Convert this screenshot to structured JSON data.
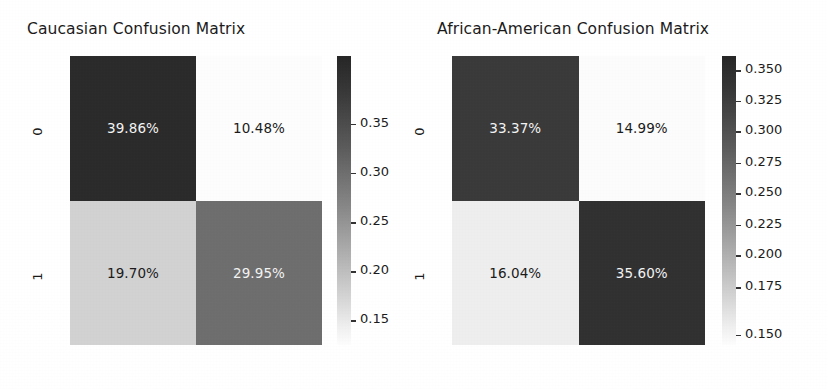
{
  "figure": {
    "background": "#ffffff",
    "colormap": "Greys",
    "panel_count": 2
  },
  "chart_data": [
    {
      "type": "heatmap",
      "title": "Caucasian Confusion Matrix",
      "xlabel": "",
      "ylabel": "",
      "x_ticklabels": [
        "0",
        "1"
      ],
      "y_ticklabels": [
        "0",
        "1"
      ],
      "grid": false,
      "annotation_format": "percent",
      "values": [
        [
          0.3986,
          0.1048
        ],
        [
          0.197,
          0.2995
        ]
      ],
      "annotations": [
        [
          "39.86%",
          "10.48%"
        ],
        [
          "19.70%",
          "29.95%"
        ]
      ],
      "cell_colors": [
        [
          "#2b2b2b",
          "#fdfdfd"
        ],
        [
          "#d2d2d2",
          "#6e6e6e"
        ]
      ],
      "text_colors": [
        [
          "#f2f2f2",
          "#1b1b1b"
        ],
        [
          "#1b1b1b",
          "#f2f2f2"
        ]
      ],
      "colorbar": {
        "position": "right",
        "vmin": 0.1048,
        "vmax": 0.3986,
        "ticks": [
          0.35,
          0.3,
          0.25,
          0.2,
          0.15
        ],
        "ticklabels": [
          "0.35",
          "0.30",
          "0.25",
          "0.20",
          "0.15"
        ],
        "tick_positions_pct": [
          23.5,
          40.5,
          57.5,
          74.5,
          91.5
        ]
      }
    },
    {
      "type": "heatmap",
      "title": "African-American Confusion Matrix",
      "xlabel": "",
      "ylabel": "",
      "x_ticklabels": [
        "0",
        "1"
      ],
      "y_ticklabels": [
        "0",
        "1"
      ],
      "grid": false,
      "annotation_format": "percent",
      "values": [
        [
          0.3337,
          0.1499
        ],
        [
          0.1604,
          0.356
        ]
      ],
      "annotations": [
        [
          "33.37%",
          "14.99%"
        ],
        [
          "16.04%",
          "35.60%"
        ]
      ],
      "cell_colors": [
        [
          "#3a3a3a",
          "#fcfcfc"
        ],
        [
          "#eeeeee",
          "#313131"
        ]
      ],
      "text_colors": [
        [
          "#f2f2f2",
          "#1b1b1b"
        ],
        [
          "#1b1b1b",
          "#f2f2f2"
        ]
      ],
      "colorbar": {
        "position": "right",
        "vmin": 0.1499,
        "vmax": 0.356,
        "ticks": [
          0.35,
          0.325,
          0.3,
          0.275,
          0.25,
          0.225,
          0.2,
          0.175,
          0.15
        ],
        "ticklabels": [
          "0.350",
          "0.325",
          "0.300",
          "0.275",
          "0.250",
          "0.225",
          "0.200",
          "0.175",
          "0.150"
        ],
        "tick_positions_pct": [
          5.0,
          15.5,
          26.0,
          37.0,
          47.5,
          58.5,
          69.0,
          80.0,
          96.5
        ]
      }
    }
  ]
}
